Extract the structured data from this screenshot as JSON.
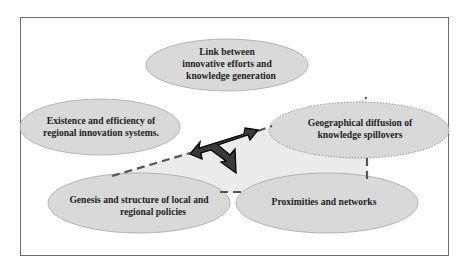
{
  "diagram": {
    "nodes": [
      {
        "id": "link",
        "lines": [
          "Link between",
          "innovative efforts and",
          "knowledge generation"
        ]
      },
      {
        "id": "existence",
        "lines": [
          "Existence and efficiency of",
          "regional innovation systems."
        ]
      },
      {
        "id": "geo",
        "lines": [
          "Geographical diffusion of",
          "knowledge spillovers"
        ]
      },
      {
        "id": "genesis",
        "lines": [
          "Genesis and structure of local and",
          "regional policies"
        ]
      },
      {
        "id": "proximities",
        "lines": [
          "Proximities and networks"
        ]
      }
    ],
    "colors": {
      "ellipse_fill": "#d9d9d9",
      "ellipse_stroke": "#a6a6a6",
      "region_fill": "#ebebeb",
      "dash": "#555555",
      "arrow_fill": "#3a3a3a",
      "arrow_stroke": "#000000",
      "frame": "#6b6b6b"
    }
  }
}
